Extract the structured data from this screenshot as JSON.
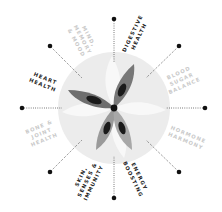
{
  "diagram": {
    "center": {
      "x": 114,
      "y": 108
    },
    "colors": {
      "background": "#ffffff",
      "circle": "#ececec",
      "petal_ghost": "#f7f7f7",
      "petal_dark": "#6e6e6e",
      "petal_mid": "#8a8a8a",
      "petal_light": "#a8a8a8",
      "petal_core": "#1a1a1a",
      "label_dark": "#222222",
      "label_light": "#c9c9c9",
      "dot": "#111111",
      "line": "#333333"
    },
    "labels": [
      {
        "id": "mind",
        "line1": "MIND,",
        "line2": "MEMORY",
        "line3": "& MOOD",
        "tone": "light"
      },
      {
        "id": "digestive",
        "line1": "DIGESTIVE",
        "line2": "HEALTH",
        "tone": "dark"
      },
      {
        "id": "blood-sugar",
        "line1": "BLOOD",
        "line2": "SUGAR",
        "line3": "BALANCE",
        "tone": "light"
      },
      {
        "id": "hormone",
        "line1": "HORMONE",
        "line2": "HARMONY",
        "tone": "light"
      },
      {
        "id": "energy",
        "line1": "ENERGY",
        "line2": "BOOSTING",
        "tone": "dark"
      },
      {
        "id": "skin",
        "line1": "SKIN,",
        "line2": "SENSES &",
        "line3": "IMMUNITY",
        "tone": "dark"
      },
      {
        "id": "bone",
        "line1": "BONE &",
        "line2": "JOINT",
        "line3": "HEALTH",
        "tone": "light"
      },
      {
        "id": "heart",
        "line1": "HEART",
        "line2": "HEALTH",
        "tone": "dark"
      }
    ]
  }
}
